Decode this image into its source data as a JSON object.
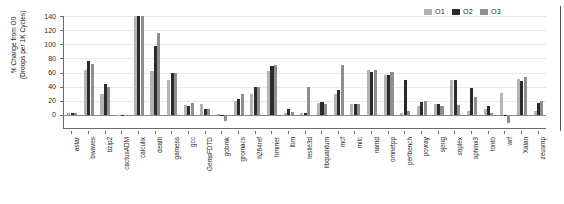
{
  "chart_data": {
    "type": "bar",
    "title": "",
    "xlabel": "",
    "ylabel": "% Change from O0\n(Droops per 1K Cycles)",
    "ylim": [
      -20,
      140
    ],
    "yticks": [
      0,
      20,
      40,
      60,
      80,
      100,
      120,
      140
    ],
    "ytick_labels": [
      "0",
      "20",
      "40",
      "60",
      "80",
      "100",
      "120",
      "140"
    ],
    "grid": true,
    "legend_position": "top-right",
    "clip_note": "calculix bars exceed the 140 axis maximum and are clipped at the top",
    "categories": [
      "astar",
      "bwaves",
      "bzip2",
      "cactusADM",
      "calculix",
      "dealII",
      "gamess",
      "gcc",
      "GemsFDTD",
      "gobmk",
      "gromacs",
      "h264ref",
      "hmmer",
      "lbm",
      "leslie3d",
      "libquantum",
      "mcf",
      "milc",
      "namd",
      "omnetpp",
      "perlbench",
      "povray",
      "sjeng",
      "soplex",
      "sphinx3",
      "tonto",
      "wrf",
      "Xalan",
      "zeusmp"
    ],
    "series": [
      {
        "name": "O1",
        "color": "#b3b3b3",
        "values": [
          2,
          64,
          30,
          -2,
          145,
          62,
          49,
          14,
          16,
          1,
          20,
          30,
          62,
          3,
          2,
          17,
          29,
          15,
          64,
          56,
          3,
          13,
          15,
          49,
          5,
          9,
          31,
          51,
          5
        ]
      },
      {
        "name": "O2",
        "color": "#2b2b2b",
        "values": [
          3,
          76,
          44,
          0,
          145,
          97,
          60,
          13,
          8,
          -1,
          22,
          39,
          69,
          8,
          3,
          18,
          35,
          16,
          61,
          56,
          50,
          18,
          16,
          50,
          38,
          12,
          -1,
          48,
          17
        ]
      },
      {
        "name": "O3",
        "color": "#8f8f8f",
        "values": [
          3,
          72,
          40,
          0,
          145,
          116,
          60,
          17,
          8,
          -9,
          29,
          39,
          70,
          4,
          39,
          16,
          71,
          15,
          64,
          61,
          5,
          20,
          13,
          14,
          26,
          2,
          -11,
          53,
          20
        ]
      }
    ]
  },
  "legend": {
    "entries": [
      {
        "label": "O1",
        "color": "#b3b3b3"
      },
      {
        "label": "O2",
        "color": "#2b2b2b"
      },
      {
        "label": "O3",
        "color": "#8f8f8f"
      }
    ]
  }
}
